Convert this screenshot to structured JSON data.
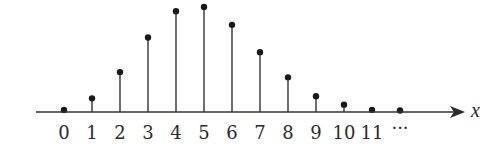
{
  "chart_data": {
    "type": "stem",
    "title": "",
    "xlabel": "x",
    "ylabel": "",
    "x": [
      0,
      1,
      2,
      3,
      4,
      5,
      6,
      7,
      8,
      9,
      10,
      11,
      12
    ],
    "tick_labels": [
      "0",
      "1",
      "2",
      "3",
      "4",
      "5",
      "6",
      "7",
      "8",
      "9",
      "10",
      "11",
      "···"
    ],
    "values": [
      0.02,
      0.13,
      0.38,
      0.71,
      0.96,
      1.0,
      0.83,
      0.57,
      0.33,
      0.15,
      0.07,
      0.02,
      0.01
    ],
    "ylim": [
      0,
      1.0
    ],
    "y_axis_visible": false,
    "grid": false,
    "legend": null,
    "annotations": [
      "x-axis arrow pointing right",
      "ellipsis after 11 indicates continuation"
    ]
  },
  "colors": {
    "line": "#333333",
    "marker": "#1a1a1a",
    "text": "#2a2a2a",
    "background": "#ffffff"
  }
}
